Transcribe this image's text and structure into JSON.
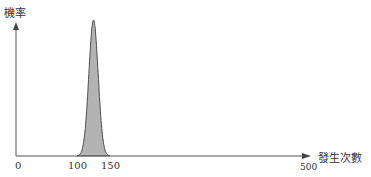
{
  "chart_data": {
    "type": "area",
    "title": "",
    "xlabel": "發生次數",
    "ylabel": "機率",
    "xticks": [
      "0",
      "100",
      "150",
      "500"
    ],
    "xlim": [
      0,
      500
    ],
    "grid": false,
    "legend": null,
    "series": [
      {
        "name": "機率分佈",
        "distribution": "normal-like",
        "peak_x": 125,
        "support": [
          100,
          150
        ],
        "fill": "#b0b0b0",
        "stroke": "#555555"
      }
    ]
  },
  "axes": {
    "y_label": "機率",
    "x_label": "發生次數",
    "ticks": {
      "zero": "0",
      "t100": "100",
      "t150": "150",
      "t500": "500"
    }
  },
  "colors": {
    "axis": "#555555",
    "fill": "#b3b3b3",
    "stroke": "#4d4d4d"
  }
}
